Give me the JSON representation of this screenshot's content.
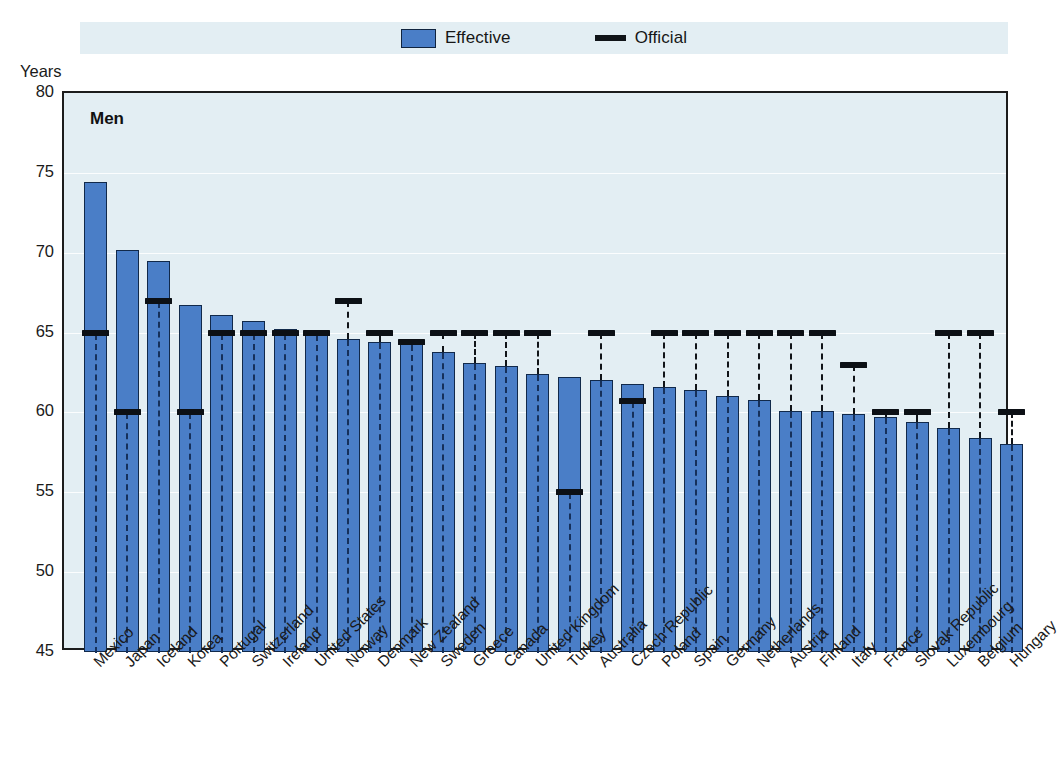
{
  "axis_title": "Years",
  "panel_label": "Men",
  "legend": [
    {
      "name": "effective",
      "label": "Effective",
      "marker": "swatch",
      "color": "#4a7ec7"
    },
    {
      "name": "official",
      "label": "Official",
      "marker": "line",
      "color": "#101418"
    }
  ],
  "chart_data": {
    "type": "bar",
    "title": "",
    "subtitle": "",
    "panel": "Men",
    "xlabel": "",
    "ylabel": "Years",
    "ylim": [
      45,
      80
    ],
    "yticks": [
      45,
      50,
      55,
      60,
      65,
      70,
      75,
      80
    ],
    "grid": true,
    "legend_position": "top-center",
    "categories": [
      "Mexico",
      "Japan",
      "Iceland",
      "Korea",
      "Portugal",
      "Switzerland",
      "Ireland",
      "United States",
      "Norway",
      "Denmark",
      "New Zealand",
      "Sweden",
      "Greece",
      "Canada",
      "United Kingdom",
      "Turkey",
      "Australia",
      "Czech Republic",
      "Poland",
      "Spain",
      "Germany",
      "Netherlands",
      "Austria",
      "Finland",
      "Italy",
      "France",
      "Slovak Republic",
      "Luxembourg",
      "Belgium",
      "Hungary"
    ],
    "series": [
      {
        "name": "Effective",
        "color": "#4a7ec7",
        "values": [
          74.4,
          70.2,
          69.5,
          66.7,
          66.1,
          65.7,
          65.2,
          64.9,
          64.6,
          64.4,
          64.3,
          63.8,
          63.1,
          62.9,
          62.4,
          62.2,
          62.0,
          61.8,
          61.6,
          61.4,
          61.0,
          60.8,
          60.1,
          60.1,
          59.9,
          59.7,
          59.4,
          59.0,
          58.4,
          58.0
        ]
      },
      {
        "name": "Official",
        "color": "#101418",
        "values": [
          65,
          60,
          67,
          60,
          65,
          65,
          65,
          65,
          67,
          65,
          64.4,
          65,
          65,
          65,
          65,
          55,
          65,
          60.7,
          65,
          65,
          65,
          65,
          65,
          65,
          63,
          60,
          60,
          65,
          65,
          60
        ]
      }
    ]
  }
}
